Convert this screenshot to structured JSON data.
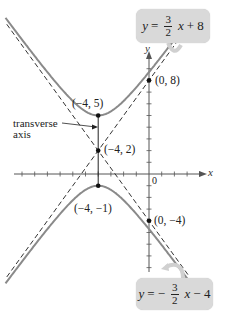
{
  "chart_data": {
    "type": "diagram",
    "equation_hyperbola": "(y-2)^2/9 - (x+4)^2/4 = 1",
    "center": [
      -4,
      2
    ],
    "vertices": [
      [
        -4,
        5
      ],
      [
        -4,
        -1
      ]
    ],
    "asymptotes": [
      {
        "equation": "y = 3/2 x + 8",
        "slope": 1.5,
        "intercept": 8
      },
      {
        "equation": "y = -3/2 x - 4",
        "slope": -1.5,
        "intercept": -4
      }
    ],
    "labeled_points": [
      {
        "label": "(-4, 5)",
        "x": -4,
        "y": 5
      },
      {
        "label": "(-4, 2)",
        "x": -4,
        "y": 2
      },
      {
        "label": "(-4, -1)",
        "x": -4,
        "y": -1
      },
      {
        "label": "(0, 8)",
        "x": 0,
        "y": 8
      },
      {
        "label": "(0, -4)",
        "x": 0,
        "y": -4
      }
    ],
    "xlabel": "x",
    "ylabel": "y",
    "origin_label": "0",
    "xlim": [
      -11.7,
      6
    ],
    "ylim": [
      -11.8,
      13.5
    ],
    "grid": false
  },
  "labels": {
    "pt_top": "(−4, 5)",
    "pt_center": "(−4, 2)",
    "pt_bottom": "(−4, −1)",
    "pt_y8": "(0, 8)",
    "pt_ym4": "(0, −4)",
    "transverse_line1": "transverse",
    "transverse_line2": "axis",
    "x_axis": "x",
    "y_axis": "y",
    "origin": "0"
  },
  "callouts": {
    "top": {
      "lhs": "y",
      "eq": "=",
      "sign": "",
      "num": "3",
      "den": "2",
      "var": "x",
      "rest": "+ 8"
    },
    "bottom": {
      "lhs": "y",
      "eq": "=",
      "sign": "−",
      "num": "3",
      "den": "2",
      "var": "x",
      "rest": "− 4"
    }
  },
  "colors": {
    "curve": "#8a8a8a",
    "dashed": "#333333",
    "axis": "#555555",
    "bubble": "#d9d9d9",
    "point": "#111111"
  }
}
